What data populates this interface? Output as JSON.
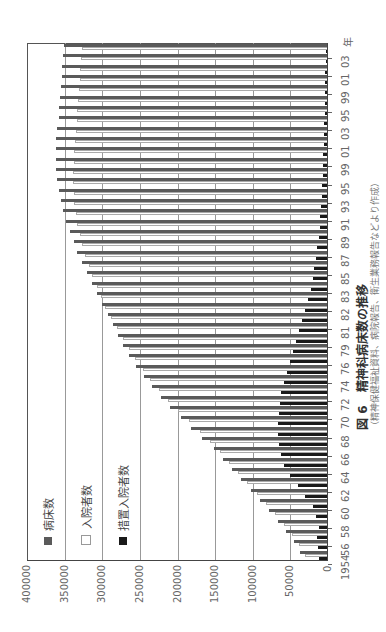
{
  "chart_data": {
    "type": "bar",
    "orientation": "horizontal (image rotated 90° CCW)",
    "title": "精神科病床数の推移",
    "figure_label": "図 6",
    "subtitle": "（精神保健福祉資料、病院報告、衛生業務報告などより作成）",
    "xlabel": "年",
    "ylabel": "",
    "value_axis_ticks": [
      "400000",
      "350000",
      "300000",
      "250000",
      "200000",
      "150000",
      "100000",
      "50000",
      "0"
    ],
    "ylim": [
      0,
      400000
    ],
    "category_tick_labels": [
      "1954",
      "56",
      "58",
      "60",
      "62",
      "64",
      "66",
      "68",
      "70",
      "72",
      "74",
      "76",
      "79",
      "81",
      "82",
      "83",
      "85",
      "87",
      "89",
      "91",
      "93",
      "95",
      "99",
      "01",
      "03",
      "95",
      "99",
      "01",
      "03"
    ],
    "year_unit_label": "年",
    "legend": [
      "病床数",
      "入院者数",
      "措置入院者数"
    ],
    "legend_colors": {
      "病床数": "#5a5a5a",
      "入院者数": "#ffffff",
      "措置入院者数": "#1a1a1a"
    },
    "grid": true,
    "series": [
      {
        "name": "病床数",
        "values": [
          37000,
          45000,
          56000,
          66000,
          78000,
          90000,
          102000,
          115000,
          128000,
          140000,
          152000,
          168000,
          182000,
          196000,
          210000,
          222000,
          234000,
          245000,
          255000,
          264000,
          272000,
          279000,
          286000,
          293000,
          300000,
          307000,
          313000,
          320000,
          327000,
          333000,
          338000,
          343000,
          348000,
          352000,
          355000,
          358000,
          360000,
          362000,
          362000,
          362000,
          361000,
          360000,
          358000,
          357000,
          356000,
          355000,
          354000,
          353000,
          352000,
          351000
        ]
      },
      {
        "name": "入院者数",
        "values": [
          30000,
          38000,
          48000,
          58000,
          70000,
          82000,
          95000,
          108000,
          120000,
          131000,
          144000,
          157000,
          170000,
          185000,
          200000,
          212000,
          224000,
          236000,
          246000,
          256000,
          265000,
          273000,
          280000,
          288000,
          296000,
          302000,
          307000,
          313000,
          318000,
          323000,
          327000,
          330000,
          333000,
          335000,
          337000,
          338000,
          339000,
          339000,
          338000,
          337000,
          336000,
          335000,
          334000,
          333000,
          332000,
          331000,
          330000,
          329000,
          328000,
          327000
        ]
      },
      {
        "name": "措置入院者数",
        "values": [
          12000,
          13000,
          14000,
          12000,
          16000,
          20000,
          30000,
          40000,
          50000,
          58000,
          62000,
          65000,
          66000,
          66000,
          65000,
          64000,
          62000,
          59000,
          55000,
          50000,
          46000,
          42000,
          38000,
          34000,
          30000,
          26000,
          22000,
          20000,
          18000,
          16000,
          14000,
          12000,
          11000,
          10000,
          9000,
          8000,
          7500,
          7000,
          6500,
          6000,
          5500,
          5000,
          4800,
          4500,
          4200,
          4000,
          3800,
          3500,
          3200,
          3000
        ]
      }
    ]
  },
  "legend": {
    "items": [
      {
        "label": "病床数",
        "color": "#5a5a5a"
      },
      {
        "label": "入院者数",
        "color": "#ffffff"
      },
      {
        "label": "措置入院者数",
        "color": "#1a1a1a"
      }
    ]
  },
  "caption": {
    "label": "図 6",
    "title": "精神科病床数の推移",
    "source": "（精神保健福祉資料、病院報告、衛生業務報告などより作成）"
  }
}
